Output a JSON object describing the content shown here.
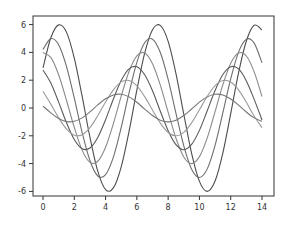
{
  "chart_data": {
    "type": "line",
    "title": "",
    "xlabel": "",
    "ylabel": "",
    "xlim": [
      -0.65,
      14.75
    ],
    "ylim": [
      -6.6,
      6.6
    ],
    "grid": false,
    "legend": null,
    "xticks": [
      "0",
      "2",
      "4",
      "6",
      "8",
      "10",
      "12",
      "14"
    ],
    "yticks": [
      "-6",
      "-4",
      "-2",
      "0",
      "2",
      "4",
      "6"
    ],
    "x": [
      0,
      0.5,
      1,
      1.5,
      2,
      2.5,
      3,
      3.5,
      4,
      4.5,
      5,
      5.5,
      6,
      6.5,
      7,
      7.5,
      8,
      8.5,
      9,
      9.5,
      10,
      10.5,
      11,
      11.5,
      12,
      12.5,
      13,
      13.5,
      14
    ],
    "series": [
      {
        "name": "6*sin(x+0.5)",
        "color": "#4d4d4d",
        "values": [
          2.88,
          5.05,
          5.98,
          5.46,
          3.59,
          0.85,
          -2.1,
          -4.54,
          -5.87,
          -5.75,
          -4.23,
          -1.68,
          1.29,
          3.94,
          5.63,
          5.94,
          4.79,
          2.47,
          -0.45,
          -3.26,
          -5.28,
          -6.0,
          -5.25,
          -3.22,
          -0.4,
          2.52,
          4.82,
          5.95,
          5.61
        ]
      },
      {
        "name": "5*sin(x+1)",
        "color": "#6e6e6e",
        "values": [
          4.21,
          4.99,
          4.55,
          2.99,
          0.71,
          -1.75,
          -3.78,
          -4.89,
          -4.79,
          -3.53,
          -1.4,
          1.08,
          3.28,
          4.69,
          4.95,
          3.99,
          2.06,
          -0.38,
          -2.72,
          -4.4,
          -5.0,
          -4.38,
          -2.69,
          -0.33,
          2.1,
          4.02,
          4.95,
          4.67,
          3.25
        ]
      },
      {
        "name": "4*sin(x+1.5)",
        "color": "#8a8a8a",
        "values": [
          3.99,
          3.64,
          2.39,
          0.56,
          -1.4,
          -3.03,
          -3.91,
          -3.83,
          -2.82,
          -1.12,
          0.86,
          2.63,
          3.75,
          3.96,
          3.19,
          1.65,
          -0.3,
          -2.18,
          -3.52,
          -4.0,
          -3.5,
          -2.15,
          -0.26,
          1.68,
          3.22,
          3.96,
          3.74,
          2.6,
          0.83
        ]
      },
      {
        "name": "3*sin(x+2)",
        "color": "#5a5a5a",
        "values": [
          2.73,
          1.8,
          0.42,
          -1.05,
          -2.27,
          -2.93,
          -2.88,
          -2.12,
          -0.84,
          0.65,
          1.97,
          2.81,
          2.97,
          2.39,
          1.24,
          -0.23,
          -1.63,
          -2.64,
          -3.0,
          -2.62,
          -1.61,
          -0.2,
          1.26,
          2.41,
          2.97,
          2.81,
          1.95,
          0.62,
          -0.86
        ]
      },
      {
        "name": "2*sin(x+2.5)",
        "color": "#9a9a9a",
        "values": [
          1.2,
          0.28,
          -0.7,
          -1.51,
          -1.96,
          -1.92,
          -1.41,
          -0.56,
          0.43,
          1.31,
          1.88,
          1.98,
          1.6,
          0.82,
          -0.15,
          -1.09,
          -1.76,
          -2.0,
          -1.75,
          -1.07,
          -0.13,
          0.84,
          1.61,
          1.98,
          1.87,
          1.3,
          0.41,
          -0.58,
          -1.42
        ]
      },
      {
        "name": "1*sin(x+3)",
        "color": "#767676",
        "values": [
          0.14,
          -0.35,
          -0.76,
          -0.98,
          -0.96,
          -0.71,
          -0.28,
          0.22,
          0.66,
          0.94,
          0.99,
          0.8,
          0.41,
          -0.08,
          -0.54,
          -0.88,
          -1.0,
          -0.88,
          -0.54,
          -0.07,
          0.42,
          0.8,
          0.99,
          0.94,
          0.65,
          0.21,
          -0.29,
          -0.71,
          -0.96
        ]
      }
    ]
  }
}
